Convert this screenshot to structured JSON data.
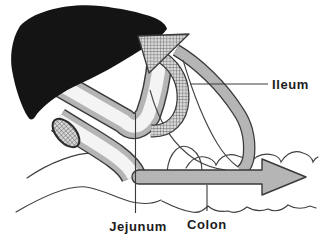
{
  "diagram": {
    "labels": {
      "ileum": "Ileum",
      "jejunum": "Jejunum",
      "colon": "Colon"
    },
    "colors": {
      "background": "#ffffff",
      "liver_black": "#141414",
      "outline_ink": "#3a3a3a",
      "tube_wall_gray": "#b5b5b5",
      "tube_lumen": "#f4f4f4",
      "colon_gray": "#b5b5b5",
      "hatch_base": "#d8d8d8",
      "hatch_line": "#4a4a4a",
      "wave_line": "#3f3f3f",
      "label_ink": "#1c1c1c"
    }
  }
}
